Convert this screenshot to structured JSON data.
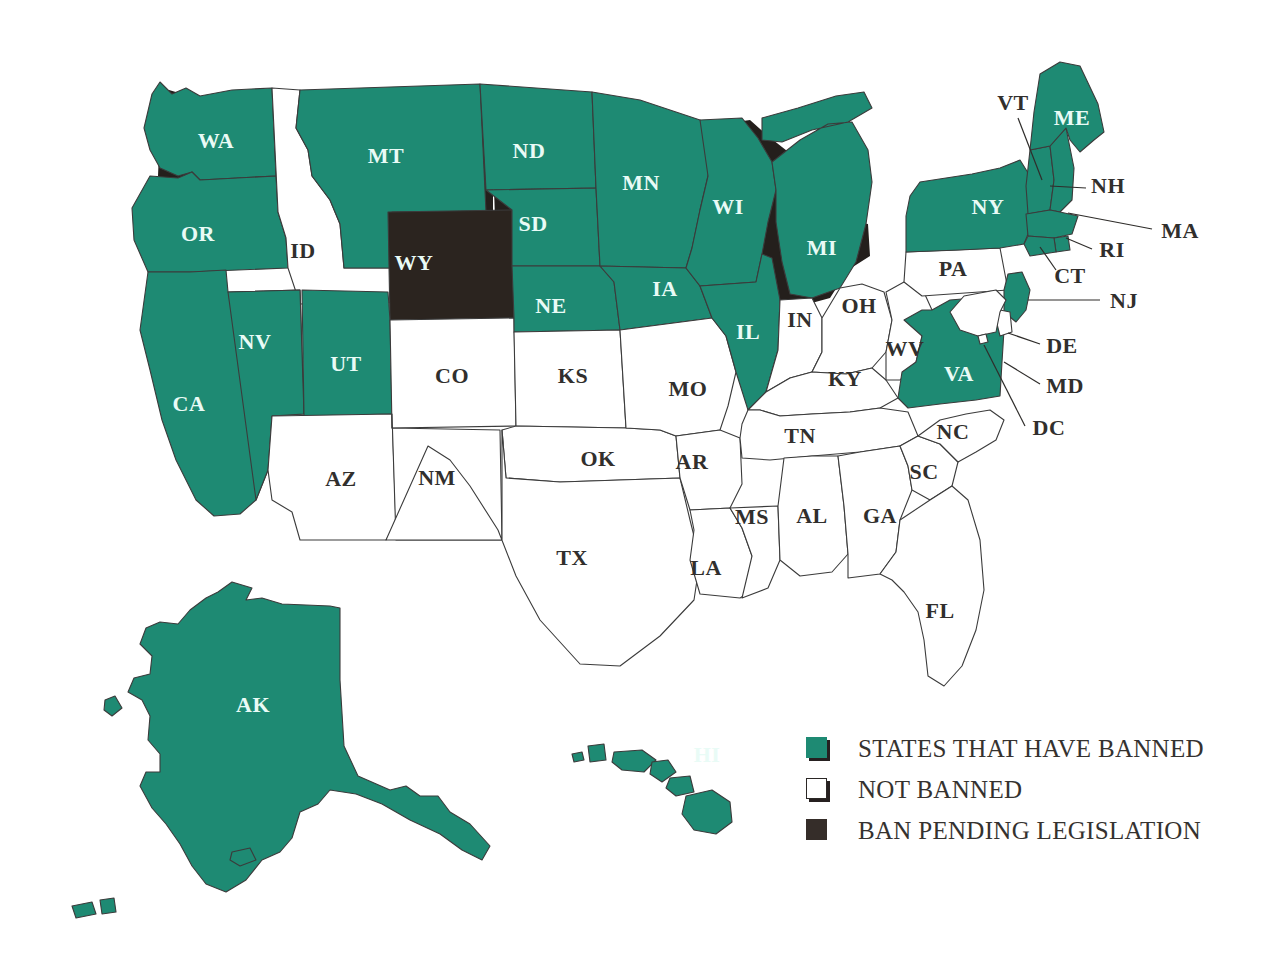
{
  "map": {
    "title": "United States map of state ban status",
    "colors": {
      "banned": "#1e8a73",
      "not_banned": "#ffffff",
      "pending": "#2b241f",
      "border": "#3b3b3b",
      "shadow": "#241f1c",
      "label_on_fill": "#e9fbf6",
      "label_on_white": "#312f2d"
    },
    "states": [
      {
        "code": "WA",
        "status": "banned",
        "label_x": 216,
        "label_y": 143,
        "leader": null
      },
      {
        "code": "OR",
        "status": "banned",
        "label_x": 198,
        "label_y": 236,
        "leader": null
      },
      {
        "code": "CA",
        "status": "banned",
        "label_x": 189,
        "label_y": 406,
        "leader": null
      },
      {
        "code": "NV",
        "status": "banned",
        "label_x": 255,
        "label_y": 344,
        "leader": null
      },
      {
        "code": "ID",
        "status": "not_banned",
        "label_x": 303,
        "label_y": 253,
        "leader": null
      },
      {
        "code": "MT",
        "status": "banned",
        "label_x": 386,
        "label_y": 158,
        "leader": null
      },
      {
        "code": "WY",
        "status": "pending",
        "label_x": 414,
        "label_y": 265,
        "leader": null
      },
      {
        "code": "UT",
        "status": "banned",
        "label_x": 346,
        "label_y": 366,
        "leader": null
      },
      {
        "code": "AZ",
        "status": "not_banned",
        "label_x": 341,
        "label_y": 481,
        "leader": null
      },
      {
        "code": "CO",
        "status": "not_banned",
        "label_x": 452,
        "label_y": 378,
        "leader": null
      },
      {
        "code": "NM",
        "status": "not_banned",
        "label_x": 437,
        "label_y": 480,
        "leader": null
      },
      {
        "code": "ND",
        "status": "banned",
        "label_x": 529,
        "label_y": 153,
        "leader": null
      },
      {
        "code": "SD",
        "status": "banned",
        "label_x": 533,
        "label_y": 226,
        "leader": null
      },
      {
        "code": "NE",
        "status": "banned",
        "label_x": 551,
        "label_y": 308,
        "leader": null
      },
      {
        "code": "KS",
        "status": "not_banned",
        "label_x": 573,
        "label_y": 378,
        "leader": null
      },
      {
        "code": "OK",
        "status": "not_banned",
        "label_x": 598,
        "label_y": 461,
        "leader": null
      },
      {
        "code": "TX",
        "status": "not_banned",
        "label_x": 572,
        "label_y": 560,
        "leader": null
      },
      {
        "code": "MN",
        "status": "banned",
        "label_x": 641,
        "label_y": 185,
        "leader": null
      },
      {
        "code": "IA",
        "status": "banned",
        "label_x": 665,
        "label_y": 291,
        "leader": null
      },
      {
        "code": "MO",
        "status": "not_banned",
        "label_x": 688,
        "label_y": 391,
        "leader": null
      },
      {
        "code": "AR",
        "status": "not_banned",
        "label_x": 692,
        "label_y": 464,
        "leader": null
      },
      {
        "code": "LA",
        "status": "not_banned",
        "label_x": 706,
        "label_y": 570,
        "leader": null
      },
      {
        "code": "WI",
        "status": "banned",
        "label_x": 728,
        "label_y": 209,
        "leader": null
      },
      {
        "code": "IL",
        "status": "banned",
        "label_x": 748,
        "label_y": 334,
        "leader": null
      },
      {
        "code": "MS",
        "status": "not_banned",
        "label_x": 752,
        "label_y": 519,
        "leader": null
      },
      {
        "code": "MI",
        "status": "banned",
        "label_x": 822,
        "label_y": 250,
        "leader": null
      },
      {
        "code": "IN",
        "status": "not_banned",
        "label_x": 800,
        "label_y": 322,
        "leader": null
      },
      {
        "code": "TN",
        "status": "not_banned",
        "label_x": 800,
        "label_y": 438,
        "leader": null
      },
      {
        "code": "AL",
        "status": "not_banned",
        "label_x": 812,
        "label_y": 518,
        "leader": null
      },
      {
        "code": "OH",
        "status": "not_banned",
        "label_x": 859,
        "label_y": 308,
        "leader": null
      },
      {
        "code": "KY",
        "status": "not_banned",
        "label_x": 845,
        "label_y": 381,
        "leader": null
      },
      {
        "code": "GA",
        "status": "not_banned",
        "label_x": 880,
        "label_y": 518,
        "leader": null
      },
      {
        "code": "WV",
        "status": "not_banned",
        "label_x": 905,
        "label_y": 351,
        "leader": null
      },
      {
        "code": "SC",
        "status": "not_banned",
        "label_x": 924,
        "label_y": 474,
        "leader": null
      },
      {
        "code": "NC",
        "status": "not_banned",
        "label_x": 953,
        "label_y": 434,
        "leader": null
      },
      {
        "code": "PA",
        "status": "not_banned",
        "label_x": 953,
        "label_y": 271,
        "leader": null
      },
      {
        "code": "VA",
        "status": "banned",
        "label_x": 959,
        "label_y": 376,
        "leader": null
      },
      {
        "code": "FL",
        "status": "not_banned",
        "label_x": 940,
        "label_y": 613,
        "leader": null
      },
      {
        "code": "NY",
        "status": "banned",
        "label_x": 988,
        "label_y": 209,
        "leader": null
      },
      {
        "code": "VT",
        "status": "banned",
        "label_x": 1013,
        "label_y": 105,
        "leader": [
          1018,
          118,
          1042,
          180
        ]
      },
      {
        "code": "ME",
        "status": "banned",
        "label_x": 1072,
        "label_y": 120,
        "leader": null
      },
      {
        "code": "NH",
        "status": "banned",
        "label_x": 1108,
        "label_y": 188,
        "leader": [
          1086,
          188,
          1050,
          186
        ]
      },
      {
        "code": "MA",
        "status": "banned",
        "label_x": 1180,
        "label_y": 233,
        "leader": [
          1152,
          229,
          1068,
          213
        ]
      },
      {
        "code": "RI",
        "status": "banned",
        "label_x": 1112,
        "label_y": 252,
        "leader": [
          1092,
          249,
          1066,
          238
        ]
      },
      {
        "code": "CT",
        "status": "banned",
        "label_x": 1070,
        "label_y": 278,
        "leader": [
          1056,
          270,
          1040,
          247
        ]
      },
      {
        "code": "NJ",
        "status": "banned",
        "label_x": 1124,
        "label_y": 303,
        "leader": [
          1100,
          300,
          1028,
          300
        ]
      },
      {
        "code": "DE",
        "status": "not_banned",
        "label_x": 1062,
        "label_y": 348,
        "leader": [
          1040,
          344,
          1008,
          333
        ]
      },
      {
        "code": "MD",
        "status": "not_banned",
        "label_x": 1065,
        "label_y": 388,
        "leader": [
          1040,
          384,
          1004,
          362
        ]
      },
      {
        "code": "DC",
        "status": "not_banned",
        "label_x": 1049,
        "label_y": 430,
        "leader": [
          1025,
          426,
          984,
          345
        ]
      },
      {
        "code": "AK",
        "status": "banned",
        "label_x": 253,
        "label_y": 707,
        "leader": null
      },
      {
        "code": "HI",
        "status": "banned",
        "label_x": 707,
        "label_y": 757,
        "leader": null
      }
    ]
  },
  "legend": {
    "items": [
      {
        "swatch": "banned",
        "label": "STATES THAT HAVE BANNED"
      },
      {
        "swatch": "not_banned",
        "label": "NOT BANNED"
      },
      {
        "swatch": "pending",
        "label": "BAN PENDING LEGISLATION"
      }
    ]
  }
}
